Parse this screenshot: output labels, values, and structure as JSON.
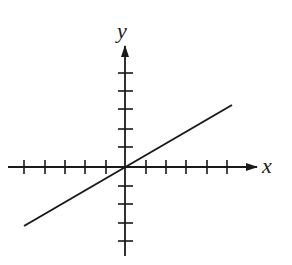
{
  "diagram": {
    "type": "coordinate-plane-line",
    "x_axis_label": "x",
    "y_axis_label": "y",
    "colors": {
      "background": "#ffffff",
      "ink": "#1a1a1a"
    },
    "origin_px": [
      125,
      167
    ],
    "x_tick_spacing_px": 20.3,
    "y_tick_spacing_px": 18.5,
    "x_ticks_left": 5,
    "x_ticks_right": 5,
    "y_ticks_above": 5,
    "y_ticks_below": 4,
    "line": {
      "description": "straight line through the origin with positive slope",
      "passes_through_origin": true,
      "start_units": [
        -5,
        -3.2
      ],
      "end_units": [
        5.3,
        3.3
      ]
    }
  }
}
